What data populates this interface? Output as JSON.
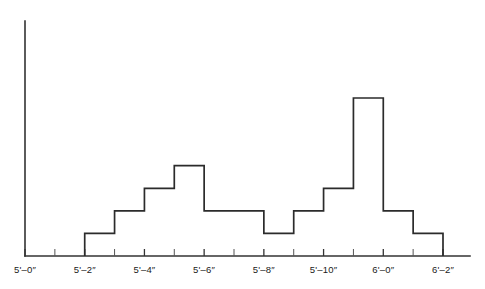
{
  "chart_data": {
    "type": "bar",
    "title": "",
    "subtitle": "",
    "xlabel": "",
    "ylabel": "",
    "grid": false,
    "legend": null,
    "axis": {
      "x_tick_labels": [
        "5'–0″",
        "5'–2″",
        "5'–4″",
        "5'–6″",
        "5'–8″",
        "5'–10″",
        "6'–0″",
        "6'–2″"
      ],
      "x_tick_values": [
        60,
        62,
        64,
        66,
        68,
        70,
        72,
        74
      ],
      "x_minor_tick_values": [
        61,
        63,
        65,
        67,
        69,
        71,
        73
      ],
      "xlim": [
        60,
        74
      ],
      "ylim": [
        0,
        11
      ],
      "y_axis_visible": true,
      "y_ticks_visible": false
    },
    "bin_width_inches": 1,
    "bin_starts": [
      60,
      61,
      62,
      63,
      64,
      65,
      66,
      67,
      68,
      69,
      70,
      71,
      72,
      73
    ],
    "bin_labels": [
      "5'–0″",
      "5'–1″",
      "5'–2″",
      "5'–3″",
      "5'–4″",
      "5'–5″",
      "5'–6″",
      "5'–7″",
      "5'–8″",
      "5'–9″",
      "5'–10″",
      "5'–11″",
      "6'–0″",
      "6'–1″"
    ],
    "categories": [
      "5'–0″",
      "5'–1″",
      "5'–2″",
      "5'–3″",
      "5'–4″",
      "5'–5″",
      "5'–6″",
      "5'–7″",
      "5'–8″",
      "5'–9″",
      "5'–10″",
      "5'–11″",
      "6'–0″",
      "6'–1″"
    ],
    "values": [
      0,
      0,
      1,
      2,
      3,
      4,
      2,
      2,
      1,
      2,
      3,
      7,
      2,
      1
    ],
    "colors": {
      "line": "#2b2b2b",
      "axis": "#333333",
      "background": "#ffffff"
    }
  }
}
